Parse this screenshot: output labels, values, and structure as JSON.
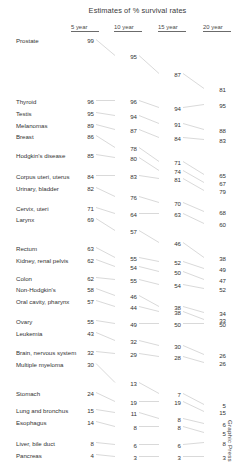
{
  "title": "Estimates of % survival rates",
  "credit": "Graphic Press",
  "columns": [
    "5 year",
    "10 year",
    "15 year",
    "20 year"
  ],
  "chart_data": {
    "type": "line",
    "title": "Estimates of % survival rates",
    "subtitle": "",
    "xlabel": "",
    "ylabel": "",
    "x": [
      "5 year",
      "10 year",
      "15 year",
      "20 year"
    ],
    "categories": [
      "5 year",
      "10 year",
      "15 year",
      "20 year"
    ],
    "ylim": [
      0,
      100
    ],
    "grid": false,
    "legend": "none",
    "annotations": [
      "Graphic Press"
    ],
    "series": [
      {
        "name": "Prostate",
        "values": [
          99,
          95,
          87,
          81
        ]
      },
      {
        "name": "Thyroid",
        "values": [
          96,
          96,
          94,
          95
        ]
      },
      {
        "name": "Testis",
        "values": [
          95,
          94,
          91,
          88
        ]
      },
      {
        "name": "Melanomas",
        "values": [
          89,
          87,
          84,
          83
        ]
      },
      {
        "name": "Breast",
        "values": [
          86,
          78,
          71,
          65
        ]
      },
      {
        "name": "Hodgkin's disease",
        "values": [
          85,
          80,
          74,
          67
        ]
      },
      {
        "name": "Corpus uteri, uterus",
        "values": [
          84,
          83,
          81,
          79
        ]
      },
      {
        "name": "Urinary, bladder",
        "values": [
          82,
          76,
          70,
          68
        ]
      },
      {
        "name": "Cervix, uteri",
        "values": [
          71,
          64,
          63,
          60
        ]
      },
      {
        "name": "Larynx",
        "values": [
          69,
          57,
          46,
          38
        ]
      },
      {
        "name": "Rectum",
        "values": [
          63,
          55,
          52,
          49
        ]
      },
      {
        "name": "Kidney, renal pelvis",
        "values": [
          62,
          54,
          50,
          47
        ]
      },
      {
        "name": "Colon",
        "values": [
          62,
          55,
          54,
          52
        ]
      },
      {
        "name": "Non-Hodgkin's",
        "values": [
          58,
          46,
          38,
          34
        ]
      },
      {
        "name": "Oral cavity, pharynx",
        "values": [
          57,
          44,
          38,
          33
        ]
      },
      {
        "name": "Ovary",
        "values": [
          55,
          49,
          50,
          50
        ]
      },
      {
        "name": "Leukemia",
        "values": [
          43,
          32,
          30,
          26
        ]
      },
      {
        "name": "Brain, nervous system",
        "values": [
          32,
          29,
          28,
          26
        ]
      },
      {
        "name": "Multiple myeloma",
        "values": [
          30,
          13,
          7,
          5
        ]
      },
      {
        "name": "Stomach",
        "values": [
          24,
          19,
          19,
          15
        ]
      },
      {
        "name": "Lung and bronchus",
        "values": [
          15,
          11,
          8,
          6
        ]
      },
      {
        "name": "Esophagus",
        "values": [
          14,
          8,
          8,
          5
        ]
      },
      {
        "name": "Liver, bile duct",
        "values": [
          8,
          6,
          6,
          8
        ]
      },
      {
        "name": "Pancreas",
        "values": [
          4,
          3,
          3,
          3
        ]
      }
    ]
  },
  "rows": [
    {
      "label": "Prostate",
      "y": 41,
      "values": [
        99,
        95,
        87,
        81
      ],
      "vy": [
        41,
        57,
        75,
        90
      ]
    },
    {
      "label": "Thyroid",
      "y": 102,
      "values": [
        96,
        96,
        94,
        95
      ],
      "vy": [
        102,
        102,
        109,
        106
      ]
    },
    {
      "label": "Testis",
      "y": 114,
      "values": [
        95,
        94,
        91,
        88
      ],
      "vy": [
        114,
        117,
        125,
        131
      ]
    },
    {
      "label": "Melanomas",
      "y": 126,
      "values": [
        89,
        87,
        84,
        83
      ],
      "vy": [
        126,
        131,
        139,
        141
      ]
    },
    {
      "label": "Breast",
      "y": 137,
      "values": [
        86,
        78,
        71,
        65
      ],
      "vy": [
        137,
        149,
        163,
        176
      ]
    },
    {
      "label": "Hodgkin's disease",
      "y": 156,
      "values": [
        85,
        80,
        74,
        67
      ],
      "vy": [
        156,
        159,
        172,
        184
      ]
    },
    {
      "label": "Corpus uteri, uterus",
      "y": 177,
      "values": [
        84,
        83,
        81,
        79
      ],
      "vy": [
        177,
        177,
        180,
        192
      ]
    },
    {
      "label": "Urinary, bladder",
      "y": 189,
      "values": [
        82,
        76,
        70,
        68
      ],
      "vy": [
        189,
        198,
        204,
        213
      ]
    },
    {
      "label": "Cervix, uteri",
      "y": 209,
      "values": [
        71,
        64,
        63,
        60
      ],
      "vy": [
        209,
        215,
        215,
        225
      ]
    },
    {
      "label": "Larynx",
      "y": 220,
      "values": [
        69,
        57,
        46,
        38
      ],
      "vy": [
        220,
        232,
        244,
        259
      ]
    },
    {
      "label": "Rectum",
      "y": 249,
      "values": [
        63,
        55,
        52,
        49
      ],
      "vy": [
        249,
        259,
        263,
        270
      ]
    },
    {
      "label": "Kidney, renal pelvis",
      "y": 261,
      "values": [
        62,
        54,
        50,
        47
      ],
      "vy": [
        261,
        268,
        273,
        281
      ]
    },
    {
      "label": "Colon",
      "y": 279,
      "values": [
        62,
        55,
        54,
        52
      ],
      "vy": [
        279,
        281,
        286,
        290
      ]
    },
    {
      "label": "Non-Hodgkin's",
      "y": 290,
      "values": [
        58,
        46,
        38,
        34
      ],
      "vy": [
        290,
        297,
        308,
        314
      ]
    },
    {
      "label": "Oral cavity, pharynx",
      "y": 302,
      "values": [
        57,
        44,
        38,
        33
      ],
      "vy": [
        302,
        308,
        313,
        321
      ]
    },
    {
      "label": "Ovary",
      "y": 322,
      "values": [
        55,
        49,
        50,
        50
      ],
      "vy": [
        322,
        325,
        325,
        325
      ]
    },
    {
      "label": "Leukemia",
      "y": 334,
      "values": [
        43,
        32,
        30,
        26
      ],
      "vy": [
        334,
        342,
        347,
        356
      ]
    },
    {
      "label": "Brain, nervous system",
      "y": 353,
      "values": [
        32,
        29,
        28,
        26
      ],
      "vy": [
        353,
        355,
        358,
        364
      ]
    },
    {
      "label": "Multiple myeloma",
      "y": 365,
      "values": [
        30,
        13,
        7,
        5
      ],
      "vy": [
        365,
        384,
        395,
        406
      ]
    },
    {
      "label": "Stomach",
      "y": 394,
      "values": [
        24,
        19,
        19,
        15
      ],
      "vy": [
        394,
        403,
        403,
        413
      ]
    },
    {
      "label": "Lung and bronchus",
      "y": 411,
      "values": [
        15,
        11,
        8,
        6
      ],
      "vy": [
        411,
        414,
        420,
        425
      ]
    },
    {
      "label": "Esophagus",
      "y": 423,
      "values": [
        14,
        8,
        8,
        5
      ],
      "vy": [
        423,
        428,
        428,
        434
      ]
    },
    {
      "label": "Liver, bile duct",
      "y": 444,
      "values": [
        8,
        6,
        6,
        8
      ],
      "vy": [
        444,
        446,
        446,
        444
      ]
    },
    {
      "label": "Pancreas",
      "y": 456,
      "values": [
        4,
        3,
        3,
        3
      ],
      "vy": [
        456,
        458,
        458,
        458
      ]
    }
  ],
  "geometry": {
    "label_x": 16,
    "col_x": [
      94,
      137,
      181,
      226
    ],
    "header_y": 24
  }
}
